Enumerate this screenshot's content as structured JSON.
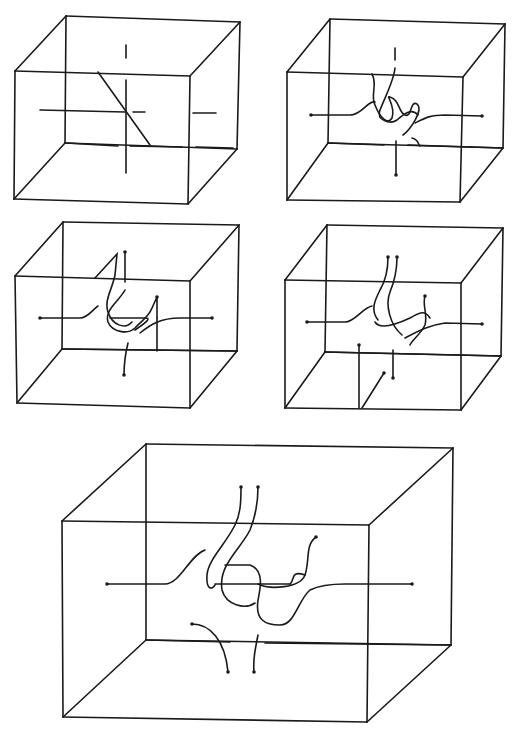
{
  "figure": {
    "width": 519,
    "height": 740,
    "background": "#ffffff",
    "ink": "#1a1a1a",
    "panels": [
      {
        "id": "cube-1",
        "front": [
          [
            15,
            71
          ],
          [
            190,
            76
          ],
          [
            188,
            204
          ],
          [
            14,
            199
          ]
        ],
        "back": [
          [
            66,
            16
          ],
          [
            240,
            22
          ],
          [
            237,
            149
          ],
          [
            65,
            143
          ]
        ],
        "strands": [
          "M40 110 L125 112",
          "M133 112 L145 112",
          "M193 113 L216 113",
          "M126 45 L126 58",
          "M126 80 L126 173",
          "M98 72 L150 145",
          "M66 143 L118 146",
          "M130 146 L182 147",
          "M196 147 L233 148"
        ],
        "endpoints": []
      },
      {
        "id": "cube-2",
        "front": [
          [
            287,
            72
          ],
          [
            463,
            77
          ],
          [
            460,
            202
          ],
          [
            287,
            200
          ]
        ],
        "back": [
          [
            330,
            19
          ],
          [
            505,
            24
          ],
          [
            503,
            148
          ],
          [
            328,
            143
          ]
        ],
        "strands": [
          "M311 115 L350 115 C362 115 368 100 375 102",
          "M372 74 C378 85 370 95 375 105 C380 118 388 125 392 118 C396 105 385 95 390 97 C400 100 398 112 405 115 C412 118 410 100 417 104 C424 110 410 130 403 135",
          "M395 48 L395 60",
          "M395 68 C394 80 386 95 380 110 C376 120 390 125 397 120 C405 113 412 108 418 115",
          "M415 123 C425 118 430 115 445 115 L482 116",
          "M396 141 L396 175",
          "M328 143 L384 145",
          "M408 145 L503 148",
          "M412 138 C420 140 418 146 420 146"
        ],
        "endpoints": [
          [
            311,
            115
          ],
          [
            482,
            116
          ],
          [
            396,
            175
          ]
        ]
      },
      {
        "id": "cube-3",
        "front": [
          [
            15,
            276
          ],
          [
            190,
            281
          ],
          [
            190,
            408
          ],
          [
            17,
            403
          ]
        ],
        "back": [
          [
            63,
            222
          ],
          [
            239,
            225
          ],
          [
            237,
            351
          ],
          [
            62,
            349
          ]
        ],
        "strands": [
          "M40 318 L80 318 C88 318 92 310 98 306",
          "M95 278 L117 254 L115 275 C112 290 104 300 108 312 C112 325 125 330 132 322",
          "M125 252 L125 282",
          "M125 290 C120 300 104 310 108 322 C112 332 128 335 135 328 C142 320 148 318 152 308 L157 297 L157 318",
          "M110 318 L145 318 C150 318 150 320 135 330",
          "M140 333 C150 325 160 318 180 318 L212 318",
          "M128 343 C125 355 124 362 124 375",
          "M157 318 L157 351",
          "M63 349 L237 351"
        ],
        "endpoints": [
          [
            40,
            318
          ],
          [
            212,
            318
          ],
          [
            124,
            375
          ],
          [
            125,
            252
          ],
          [
            157,
            297
          ]
        ]
      },
      {
        "id": "cube-4",
        "front": [
          [
            285,
            280
          ],
          [
            461,
            283
          ],
          [
            461,
            410
          ],
          [
            285,
            408
          ]
        ],
        "back": [
          [
            327,
            225
          ],
          [
            503,
            228
          ],
          [
            501,
            356
          ],
          [
            325,
            352
          ]
        ],
        "strands": [
          "M307 322 L345 322 C355 322 362 308 372 306",
          "M388 257 C388 270 386 280 380 290 C375 300 370 310 378 320",
          "M397 257 C397 268 395 280 390 292 C385 305 390 325 402 335",
          "M375 322 C380 330 395 325 410 318 C420 312 425 310 430 318",
          "M425 296 C422 305 428 315 425 325 C420 335 412 340 410 345",
          "M405 338 C420 330 430 325 445 323 L482 324",
          "M393 350 L393 378",
          "M359 345 L359 408",
          "M384 373 L362 408",
          "M325 352 L501 356"
        ],
        "endpoints": [
          [
            307,
            322
          ],
          [
            482,
            324
          ],
          [
            393,
            378
          ],
          [
            388,
            257
          ],
          [
            397,
            257
          ],
          [
            425,
            296
          ],
          [
            359,
            345
          ],
          [
            384,
            373
          ]
        ]
      },
      {
        "id": "cube-5",
        "front": [
          [
            62,
            521
          ],
          [
            369,
            525
          ],
          [
            367,
            722
          ],
          [
            63,
            717
          ]
        ],
        "back": [
          [
            146,
            444
          ],
          [
            453,
            448
          ],
          [
            451,
            645
          ],
          [
            146,
            640
          ]
        ],
        "strands": [
          "M107 584 L165 584 C180 584 190 555 205 550",
          "M241 487 C241 505 240 515 235 525 C225 545 208 560 207 575 C206 590 212 590 215 585",
          "M258 487 C258 505 254 520 250 530 C240 550 218 565 222 590 C226 605 245 610 255 603",
          "M215 584 L290 584",
          "M225 565 L250 565 C265 570 260 590 258 600 C255 620 265 625 280 625 C295 625 298 600 310 590 C320 585 330 584 345 584 L412 584",
          "M316 537 C305 545 310 560 305 575 C300 588 270 590 258 584",
          "M290 584 C295 580 290 570 305 575",
          "M192 624 C210 624 225 640 228 672",
          "M258 635 C255 650 253 660 254 672",
          "M146 640 L230 642",
          "M265 643 L451 645"
        ],
        "endpoints": [
          [
            107,
            584
          ],
          [
            412,
            584
          ],
          [
            241,
            487
          ],
          [
            258,
            487
          ],
          [
            316,
            537
          ],
          [
            192,
            624
          ],
          [
            228,
            672
          ],
          [
            254,
            672
          ]
        ]
      }
    ]
  }
}
